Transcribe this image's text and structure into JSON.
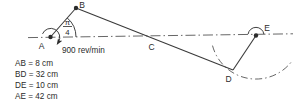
{
  "diagram": {
    "points": {
      "A": "A",
      "B": "B",
      "C": "C",
      "D": "D",
      "E": "E"
    },
    "speed_label": "900 rev/min",
    "crank_angle": {
      "numerator": "π",
      "denominator": "4"
    },
    "dimensions": [
      "AB = 8 cm",
      "BD = 32 cm",
      "DE = 10 cm",
      "AE = 42 cm"
    ]
  },
  "colors": {
    "ink": "#2b2b2b",
    "line": "#3a3a3a",
    "centerline": "#555555",
    "background": "#ffffff"
  }
}
